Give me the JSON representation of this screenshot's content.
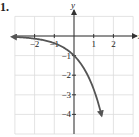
{
  "problem": {
    "label": "1."
  },
  "chart_data": {
    "type": "line",
    "title": "",
    "xlabel": "x",
    "ylabel": "y",
    "xlim": [
      -3,
      3
    ],
    "ylim": [
      -5,
      1
    ],
    "grid": true,
    "x_ticks": [
      "-2",
      "-1",
      "1",
      "2"
    ],
    "y_ticks": [
      "-1",
      "-2",
      "-3",
      "-4"
    ],
    "series": [
      {
        "name": "y = -e^x",
        "x": [
          -3,
          -2,
          -1,
          -0.5,
          0,
          0.5,
          1,
          1.25,
          1.4
        ],
        "y": [
          -0.05,
          -0.14,
          -0.37,
          -0.61,
          -1,
          -1.65,
          -2.72,
          -3.49,
          -4.06
        ],
        "arrows": "both ends",
        "color": "#555555"
      }
    ],
    "annotations": [
      "y-intercept at (0, -1)",
      "horizontal asymptote y = 0"
    ]
  }
}
